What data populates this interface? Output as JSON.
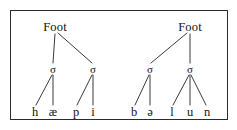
{
  "figure": {
    "type": "prosodic-tree-diagram",
    "background_color": "#ffffff",
    "line_color": "#3a3a3a",
    "text_color": "#141414",
    "frame": {
      "border_color": "#2b2b2b",
      "x": 10,
      "y": 10,
      "width": 218,
      "height": 110
    }
  },
  "trees": [
    {
      "id": "left-tree",
      "transcription": "hæpi",
      "root": {
        "label": "Foot",
        "x": 55,
        "y": 27
      },
      "syllables": [
        {
          "label": "σ",
          "x": 53,
          "y": 69,
          "branch": "vertical"
        },
        {
          "label": "σ",
          "x": 93,
          "y": 69,
          "branch": "diagonal-right"
        }
      ],
      "terminals": [
        {
          "label": "h",
          "x": 35,
          "y": 112,
          "parent": 0
        },
        {
          "label": "æ",
          "x": 53,
          "y": 112,
          "parent": 0
        },
        {
          "label": "p",
          "x": 76,
          "y": 112,
          "parent": 1
        },
        {
          "label": "i",
          "x": 93,
          "y": 112,
          "parent": 1
        }
      ]
    },
    {
      "id": "right-tree",
      "transcription": "bəlun",
      "root": {
        "label": "Foot",
        "x": 190,
        "y": 27
      },
      "syllables": [
        {
          "label": "σ",
          "x": 150,
          "y": 69,
          "branch": "diagonal-left"
        },
        {
          "label": "σ",
          "x": 190,
          "y": 69,
          "branch": "vertical"
        }
      ],
      "terminals": [
        {
          "label": "b",
          "x": 134,
          "y": 112,
          "parent": 0
        },
        {
          "label": "ə",
          "x": 150,
          "y": 112,
          "parent": 0
        },
        {
          "label": "l",
          "x": 172,
          "y": 112,
          "parent": 1
        },
        {
          "label": "u",
          "x": 190,
          "y": 112,
          "parent": 1
        },
        {
          "label": "n",
          "x": 207,
          "y": 112,
          "parent": 1
        }
      ]
    }
  ],
  "edges": [
    {
      "name": "left-foot-to-sigma1",
      "x1": 55,
      "y1": 34,
      "x2": 53,
      "y2": 63
    },
    {
      "name": "left-foot-to-sigma2",
      "x1": 58,
      "y1": 33,
      "x2": 92,
      "y2": 63
    },
    {
      "name": "left-sigma1-to-h",
      "x1": 52,
      "y1": 75,
      "x2": 36,
      "y2": 105
    },
    {
      "name": "left-sigma1-to-ae",
      "x1": 53,
      "y1": 75,
      "x2": 53,
      "y2": 105
    },
    {
      "name": "left-sigma2-to-p",
      "x1": 92,
      "y1": 75,
      "x2": 77,
      "y2": 105
    },
    {
      "name": "left-sigma2-to-i",
      "x1": 93,
      "y1": 75,
      "x2": 93,
      "y2": 105
    },
    {
      "name": "right-foot-to-sigma1",
      "x1": 187,
      "y1": 33,
      "x2": 151,
      "y2": 63
    },
    {
      "name": "right-foot-to-sigma2",
      "x1": 190,
      "y1": 34,
      "x2": 190,
      "y2": 63
    },
    {
      "name": "right-sigma1-to-b",
      "x1": 149,
      "y1": 75,
      "x2": 135,
      "y2": 105
    },
    {
      "name": "right-sigma1-to-schwa",
      "x1": 150,
      "y1": 75,
      "x2": 150,
      "y2": 105
    },
    {
      "name": "right-sigma2-to-l",
      "x1": 189,
      "y1": 75,
      "x2": 173,
      "y2": 105
    },
    {
      "name": "right-sigma2-to-u",
      "x1": 190,
      "y1": 75,
      "x2": 190,
      "y2": 105
    },
    {
      "name": "right-sigma2-to-n",
      "x1": 191,
      "y1": 75,
      "x2": 206,
      "y2": 105
    }
  ]
}
